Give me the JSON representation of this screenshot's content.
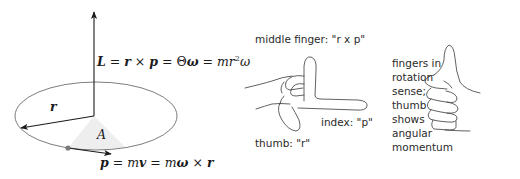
{
  "diagram": {
    "left_panel": {
      "formula_L": {
        "L": "L",
        "eq1": " = ",
        "r": "r",
        "times": " × ",
        "p": "p",
        "eq2": " = Θ",
        "omega": "ω",
        "eq3": " = ",
        "m": "mr",
        "sup": "2",
        "omega2": "ω"
      },
      "formula_p": {
        "p": "p",
        "eq1": " = ",
        "mv_m": "m",
        "v": "v",
        "eq2": " = ",
        "m2": "m",
        "omega": "ω",
        "times": " × ",
        "r": "r"
      },
      "label_r": "r",
      "label_A": "A",
      "colors": {
        "lines": "#1a1a1a",
        "ellipse": "#6e6e6e",
        "sector": "#eeeeee",
        "dot": "#7a7a7a"
      }
    },
    "middle_panel": {
      "middle_finger_label": "middle finger: \"r x p\"",
      "index_label": "index: \"p\"",
      "thumb_label": "thumb: \"r\""
    },
    "right_panel": {
      "caption_lines": [
        "fingers in",
        "rotation",
        "sense;",
        "thumb",
        "shows",
        "angular",
        "momentum"
      ]
    }
  }
}
